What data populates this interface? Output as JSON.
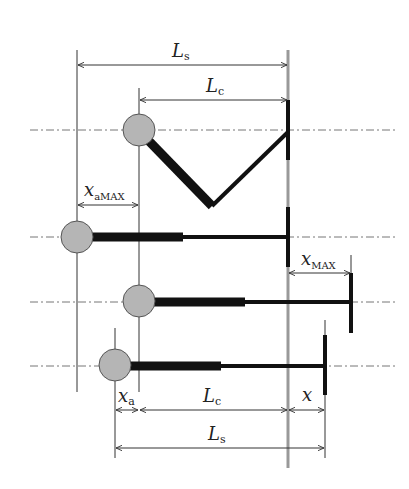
{
  "diagram": {
    "title": "",
    "colors": {
      "background": "#ffffff",
      "line": "#333333",
      "rod": "#111111",
      "wall": "#999999",
      "ball": "#b5b5b5",
      "ball_stroke": "#555555",
      "centerline": "#777777"
    },
    "labels": {
      "Ls_top": {
        "main": "L",
        "sub": "s"
      },
      "Lc_top": {
        "main": "L",
        "sub": "c"
      },
      "xaMAX": {
        "main": "x",
        "sub": "aMAX"
      },
      "xMAX": {
        "main": "x",
        "sub": "MAX"
      },
      "xa_bottom": {
        "main": "x",
        "sub": "a"
      },
      "Lc_bottom": {
        "main": "L",
        "sub": "c"
      },
      "x_bottom": {
        "main": "x",
        "sub": ""
      },
      "Ls_bottom": {
        "main": "L",
        "sub": "s"
      }
    },
    "rows": [
      {
        "name": "folded-linkage",
        "ball_x": 139,
        "y": 130,
        "vertex": [
          212,
          208
        ],
        "end_x": 288
      },
      {
        "name": "extended-max-offset",
        "ball_x": 77,
        "y": 237,
        "thick_end_x": 183,
        "end_x": 288
      },
      {
        "name": "extended-max-stroke",
        "ball_x": 139,
        "y": 302,
        "thick_end_x": 245,
        "end_x": 351
      },
      {
        "name": "general-position",
        "ball_x": 115,
        "y": 366,
        "thick_end_x": 221,
        "end_x": 325
      }
    ]
  }
}
